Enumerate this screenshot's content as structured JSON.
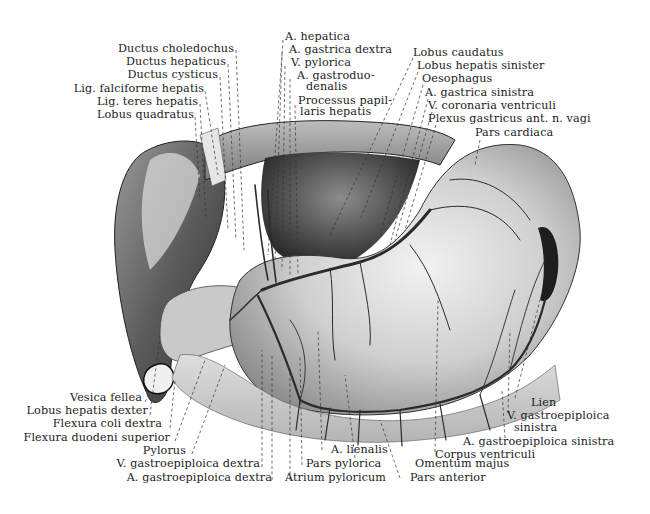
{
  "figure": {
    "palette": {
      "background": "#ffffff",
      "ink": "#1c1c1c",
      "organ_light": "#e2e2e2",
      "organ_mid": "#a8a8a8",
      "organ_dark": "#3a3a3a",
      "vessel": "#2b2b2b"
    }
  },
  "labels": {
    "top_left": [
      {
        "text": "Ductus choledochus"
      },
      {
        "text": "Ductus hepaticus"
      },
      {
        "text": "Ductus cysticus"
      },
      {
        "text": "Lig. falciforme hepatis"
      },
      {
        "text": "Lig. teres hepatis"
      },
      {
        "text": "Lobus quadratus"
      }
    ],
    "top_center": [
      {
        "text": "A. hepatica"
      },
      {
        "text": "A. gastrica dextra"
      },
      {
        "text": "V. pylorica"
      },
      {
        "text": "A. gastroduo-"
      },
      {
        "text": "denalis"
      },
      {
        "text": "Processus papil-"
      },
      {
        "text": "laris hepatis"
      }
    ],
    "top_right": [
      {
        "text": "Lobus caudatus"
      },
      {
        "text": "Lobus hepatis sinister"
      },
      {
        "text": "Oesophagus"
      },
      {
        "text": "A. gastrica sinistra"
      },
      {
        "text": "V. coronaria ventriculi"
      },
      {
        "text": "Plexus gastricus ant. n. vagi"
      },
      {
        "text": "Pars cardiaca"
      }
    ],
    "bottom_left": [
      {
        "text": "Vesica fellea"
      },
      {
        "text": "Lobus hepatis dexter"
      },
      {
        "text": "Flexura coli dextra"
      },
      {
        "text": "Flexura duodeni superior"
      },
      {
        "text": "Pylorus"
      },
      {
        "text": "V. gastroepiploica dextra"
      },
      {
        "text": "A. gastroepiploica dextra"
      }
    ],
    "bottom_center": [
      {
        "text": "A. lienalis"
      },
      {
        "text": "Pars pylorica"
      },
      {
        "text": "Atrium pyloricum"
      },
      {
        "text": "Omentum majus"
      },
      {
        "text": "Pars anterior"
      }
    ],
    "bottom_right": [
      {
        "text": "Lien"
      },
      {
        "text": "V. gastroepiploica"
      },
      {
        "text": "sinistra"
      },
      {
        "text": "A. gastroepiploica sinistra"
      },
      {
        "text": "Corpus ventriculi"
      }
    ]
  }
}
